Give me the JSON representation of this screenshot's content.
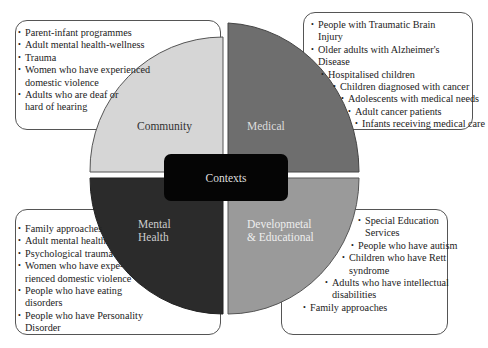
{
  "center": {
    "label": "Contexts"
  },
  "colors": {
    "community": "#d6d6d6",
    "medical": "#6e6e6e",
    "mental_health": "#2b2b2b",
    "developmental": "#9a9a9a",
    "center": "#050505"
  },
  "quadrants": {
    "community": {
      "label": "Community",
      "items": [
        "Parent-infant programmes",
        "Adult mental health-wellness",
        "Trauma",
        "Women who have experienced",
        "domestic violence",
        "Adults who are deaf or",
        "hard of hearing"
      ]
    },
    "medical": {
      "label": "Medical",
      "items": [
        "People with Traumatic Brain",
        "Injury",
        "Older adults with Alzheimer's",
        "Disease",
        "Hospitalised children",
        "Children diagnosed with cancer",
        "Adolescents with medical needs",
        "Adult cancer patients",
        "Infants receiving medical care"
      ]
    },
    "mental_health": {
      "label_line1": "Mental",
      "label_line2": "Health",
      "items": [
        "Family approaches",
        "Adult mental health",
        "Psychological trauma",
        "Women who have expe-",
        "rienced domestic violence",
        "People who have eating",
        "disorders",
        "People who have Personality",
        "Disorder"
      ]
    },
    "developmental": {
      "label_line1": "Developmetal",
      "label_line2": "& Educational",
      "items": [
        "Special Education",
        "Services",
        "People who have autism",
        "Children who have Rett",
        "syndrome",
        "Adults who have intellectual",
        "disabilities",
        "Family approaches"
      ]
    }
  }
}
